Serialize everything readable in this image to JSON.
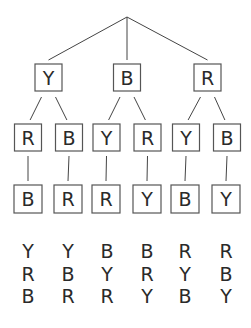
{
  "diagram": {
    "title": "",
    "tree": {
      "children": [
        {
          "label": "Y",
          "children": [
            {
              "label": "R",
              "children": [
                {
                  "label": "B"
                }
              ]
            },
            {
              "label": "B",
              "children": [
                {
                  "label": "R"
                }
              ]
            }
          ]
        },
        {
          "label": "B",
          "children": [
            {
              "label": "Y",
              "children": [
                {
                  "label": "R"
                }
              ]
            },
            {
              "label": "R",
              "children": [
                {
                  "label": "Y"
                }
              ]
            }
          ]
        },
        {
          "label": "R",
          "children": [
            {
              "label": "Y",
              "children": [
                {
                  "label": "B"
                }
              ]
            },
            {
              "label": "B",
              "children": [
                {
                  "label": "Y"
                }
              ]
            }
          ]
        }
      ]
    },
    "outcomes": [
      [
        "Y",
        "R",
        "B"
      ],
      [
        "Y",
        "B",
        "R"
      ],
      [
        "B",
        "Y",
        "R"
      ],
      [
        "B",
        "R",
        "Y"
      ],
      [
        "R",
        "Y",
        "B"
      ],
      [
        "R",
        "B",
        "Y"
      ]
    ]
  }
}
